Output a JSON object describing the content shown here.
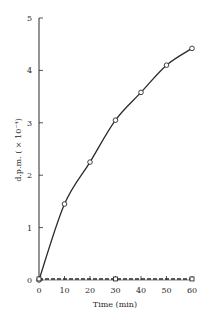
{
  "chart_data": {
    "type": "line",
    "title": "",
    "xlabel": "Time (min)",
    "ylabel": "d.p.m. ( × 10⁻⁴)",
    "xlim": [
      0,
      60
    ],
    "ylim": [
      0,
      5
    ],
    "x_ticks": [
      0,
      10,
      20,
      30,
      40,
      50,
      60
    ],
    "x_tick_labels": [
      "0",
      "10",
      "20",
      "30",
      "40",
      "50",
      "60"
    ],
    "y_ticks": [
      0,
      1,
      2,
      3,
      4,
      5
    ],
    "y_tick_labels": [
      "0",
      "1",
      "2",
      "3",
      "4",
      "5"
    ],
    "grid": false,
    "legend": null,
    "series": [
      {
        "name": "solid-curve",
        "style": "solid",
        "marker": "open-circle",
        "x": [
          0,
          10,
          20,
          30,
          40,
          50,
          60
        ],
        "values": [
          0,
          1.45,
          2.25,
          3.05,
          3.58,
          4.1,
          4.42
        ]
      },
      {
        "name": "dashed-baseline",
        "style": "dashed",
        "marker": "open-square",
        "x": [
          0,
          30,
          60
        ],
        "values": [
          0.02,
          0.02,
          0.02
        ]
      }
    ]
  },
  "colors": {
    "line": "#2a2a2a",
    "background": "#ffffff"
  }
}
